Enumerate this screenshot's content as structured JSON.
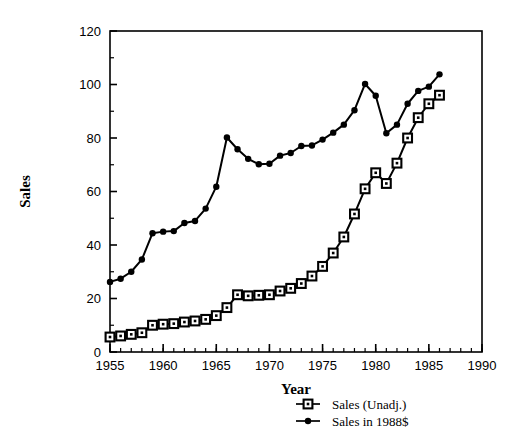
{
  "chart_data": {
    "type": "line",
    "title": "",
    "xlabel": "Year",
    "ylabel": "Sales",
    "xlim": [
      1955,
      1990
    ],
    "ylim": [
      0,
      120
    ],
    "xticks": [
      1955,
      1960,
      1965,
      1970,
      1975,
      1980,
      1985,
      1990
    ],
    "xtick_labels": [
      "1955",
      "1960",
      "1965",
      "1970",
      "1975",
      "1980",
      "1985",
      "1990"
    ],
    "yticks": [
      0,
      20,
      40,
      60,
      80,
      100,
      120
    ],
    "ytick_labels": [
      "0",
      "20",
      "40",
      "60",
      "80",
      "100",
      "120"
    ],
    "x_minor_tick_step": 1,
    "grid": false,
    "legend_position": "below-right",
    "series": [
      {
        "name": "Sales (Unadj.)",
        "marker": "open-square",
        "color": "#000000",
        "x": [
          1955,
          1956,
          1957,
          1958,
          1959,
          1960,
          1961,
          1962,
          1963,
          1964,
          1965,
          1966,
          1967,
          1968,
          1969,
          1970,
          1971,
          1972,
          1973,
          1974,
          1975,
          1976,
          1977,
          1978,
          1979,
          1980,
          1981,
          1982,
          1983,
          1984,
          1985,
          1986
        ],
        "values": [
          5.6,
          6.0,
          6.6,
          7.2,
          10.0,
          10.4,
          10.6,
          11.2,
          11.6,
          12.2,
          13.6,
          16.6,
          21.4,
          21.0,
          21.2,
          21.4,
          22.8,
          23.8,
          25.6,
          28.4,
          32.0,
          37.0,
          43.0,
          51.6,
          61.0,
          67.0,
          63.0,
          70.6,
          80.0,
          87.6,
          92.8,
          96.0
        ]
      },
      {
        "name": "Sales in 1988$",
        "marker": "filled-diamond",
        "color": "#000000",
        "x": [
          1955,
          1956,
          1957,
          1958,
          1959,
          1960,
          1961,
          1962,
          1963,
          1964,
          1965,
          1966,
          1967,
          1968,
          1969,
          1970,
          1971,
          1972,
          1973,
          1974,
          1975,
          1976,
          1977,
          1978,
          1979,
          1980,
          1981,
          1982,
          1983,
          1984,
          1985,
          1986
        ],
        "values": [
          26.2,
          27.4,
          30.0,
          34.6,
          44.4,
          45.0,
          45.2,
          48.2,
          49.0,
          53.6,
          61.8,
          80.2,
          75.8,
          72.2,
          70.2,
          70.4,
          73.4,
          74.4,
          77.0,
          77.2,
          79.4,
          82.0,
          85.0,
          90.4,
          100.2,
          95.8,
          81.8,
          85.0,
          92.8,
          97.6,
          99.2,
          103.8
        ]
      }
    ],
    "legend": [
      {
        "label": "Sales (Unadj.)",
        "marker": "open-square"
      },
      {
        "label": "Sales in 1988$",
        "marker": "filled-diamond"
      }
    ]
  }
}
